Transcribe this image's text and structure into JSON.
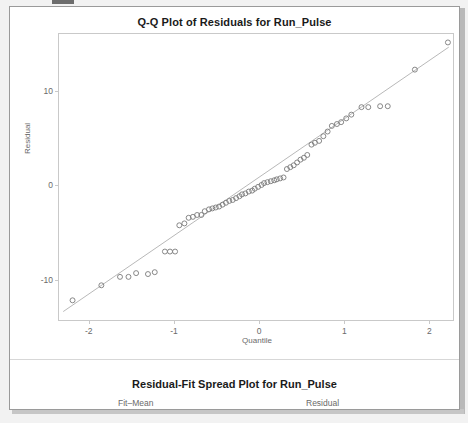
{
  "window": {
    "background_color": "#f2f2f2",
    "sheet_color": "#ffffff",
    "border_color": "#9a9a9a"
  },
  "top_panel": {
    "title": "Q-Q Plot of Residuals for Run_Pulse"
  },
  "bottom_panel": {
    "title": "Residual-Fit Spread Plot for Run_Pulse",
    "sub_left": "Fit–Mean",
    "sub_right": "Residual"
  },
  "chart_data": {
    "type": "scatter",
    "title": "Q-Q Plot of Residuals for Run_Pulse",
    "xlabel": "Quantile",
    "ylabel": "Residual",
    "xlim": [
      -2.35,
      2.3
    ],
    "ylim": [
      -14.5,
      16.0
    ],
    "xticks": [
      -2,
      -1,
      0,
      1,
      2
    ],
    "yticks": [
      10,
      0,
      -10
    ],
    "grid": false,
    "legend": null,
    "marker": "open-circle",
    "marker_color": "#7a7a7a",
    "reference_line": {
      "label": "normal reference line",
      "color": "#b0b0b0",
      "x": [
        -2.3,
        2.25
      ],
      "y": [
        -13.6,
        14.6
      ]
    },
    "x": [
      -2.19,
      -1.85,
      -1.63,
      -1.53,
      -1.44,
      -1.3,
      -1.22,
      -1.1,
      -1.04,
      -0.98,
      -0.93,
      -0.87,
      -0.82,
      -0.77,
      -0.72,
      -0.67,
      -0.63,
      -0.58,
      -0.54,
      -0.5,
      -0.46,
      -0.42,
      -0.38,
      -0.34,
      -0.3,
      -0.26,
      -0.22,
      -0.19,
      -0.15,
      -0.11,
      -0.07,
      -0.04,
      0.0,
      0.04,
      0.07,
      0.11,
      0.15,
      0.19,
      0.22,
      0.26,
      0.3,
      0.34,
      0.38,
      0.42,
      0.46,
      0.5,
      0.54,
      0.58,
      0.63,
      0.67,
      0.72,
      0.77,
      0.82,
      0.87,
      0.93,
      0.98,
      1.04,
      1.1,
      1.22,
      1.3,
      1.44,
      1.53,
      1.85,
      2.24
    ],
    "y": [
      -12.4,
      -10.8,
      -9.9,
      -9.9,
      -9.5,
      -9.6,
      -9.4,
      -7.2,
      -7.2,
      -7.2,
      -4.4,
      -4.2,
      -3.6,
      -3.5,
      -3.3,
      -3.3,
      -2.9,
      -2.7,
      -2.6,
      -2.5,
      -2.4,
      -2.2,
      -2.0,
      -1.8,
      -1.7,
      -1.5,
      -1.3,
      -1.1,
      -1.0,
      -0.8,
      -0.7,
      -0.5,
      -0.3,
      -0.1,
      0.1,
      0.2,
      0.3,
      0.4,
      0.5,
      0.6,
      0.7,
      1.6,
      1.8,
      2.0,
      2.3,
      2.6,
      2.8,
      3.1,
      4.2,
      4.4,
      4.6,
      5.1,
      5.6,
      6.2,
      6.4,
      6.6,
      7.0,
      7.4,
      8.2,
      8.2,
      8.3,
      8.3,
      12.2,
      15.1
    ]
  }
}
